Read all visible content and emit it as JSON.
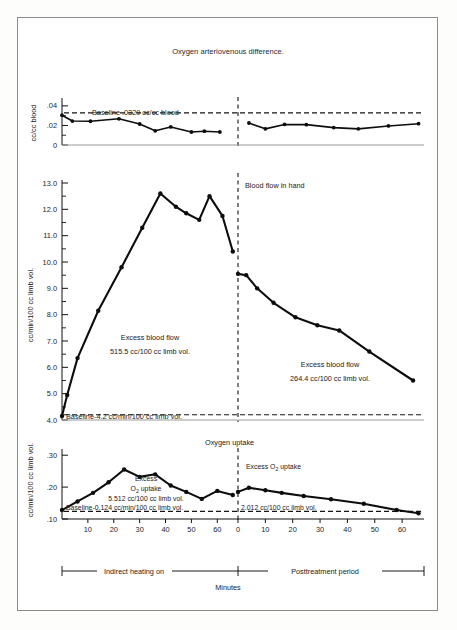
{
  "figure": {
    "title": "Oxygen arteriovenous difference.",
    "xlabel": "Minutes",
    "background": "#ffffff",
    "ink": "#0d0d0d"
  },
  "panels": {
    "top": {
      "name": "oxygen-arteriovenous-difference",
      "ylabel": "cc/cc blood",
      "ytick_labels": [
        "0",
        ".02",
        ".04"
      ],
      "baseline_label": "Baseline .0329 cc/cc blood"
    },
    "middle": {
      "name": "blood-flow-in-hand",
      "ylabel": "cc/min/100 cc limb vol.",
      "ytick_labels": [
        "4.0",
        "5.0",
        "6.0",
        "7.0",
        "8.0",
        "9.0",
        "10.0",
        "11.0",
        "12.0",
        "13.0"
      ],
      "series_label": "Blood flow in hand",
      "baseline_label": "Baseline-4.2 cc/min/100 cc limb vol.",
      "excess_left_line1": "Excess blood flow",
      "excess_left_line2": "515.5 cc/100 cc limb vol.",
      "excess_right_line1": "Excess blood flow",
      "excess_right_line2": "264.4 cc/100 cc limb vol."
    },
    "bottom": {
      "name": "oxygen-uptake",
      "ylabel": "cc/min/100 cc limb vol.",
      "ytick_labels": [
        ".10",
        ".20",
        ".30"
      ],
      "series_label": "Oxygen uptake",
      "baseline_label": "Baseline-0.124 cc/min/100 cc limb vol.",
      "excess_left_line1": "Excess",
      "excess_left_line2": "O",
      "excess_left_sub": "2",
      "excess_left_line2b": " uptake",
      "excess_left_line3": "5.512 cc/100 cc limb vol.",
      "excess_right_line1": "Excess O",
      "excess_right_sub": "2",
      "excess_right_line1b": " uptake",
      "excess_right_line2": "2.012 cc/100 cc limb vol."
    }
  },
  "xaxis": {
    "left_ticks": [
      "10",
      "20",
      "30",
      "40",
      "50",
      "60"
    ],
    "right_ticks": [
      "0",
      "10",
      "20",
      "30",
      "40",
      "50",
      "60"
    ],
    "left_range": [
      0,
      68
    ],
    "right_range": [
      0,
      68
    ]
  },
  "legend_bar": {
    "left_label": "Indirect heating on",
    "right_label": "Posttreatment period"
  },
  "chart_data": {
    "type": "line",
    "title": "Oxygen arteriovenous difference.",
    "xlabel": "Minutes",
    "panels": [
      {
        "id": "oxygen-arteriovenous-difference",
        "title": "Oxygen arteriovenous difference.",
        "ylabel": "cc/cc blood",
        "ylim": [
          0,
          0.045
        ],
        "yticks": [
          0,
          0.02,
          0.04
        ],
        "ytick_labels": [
          "0",
          ".02",
          ".04"
        ],
        "baseline_value": 0.0329,
        "baseline_label": "Baseline .0329 cc/cc blood",
        "grid": false,
        "series": [
          {
            "name": "Oxygen arteriovenous difference",
            "phase": "indirect-heating-on",
            "x": [
              0,
              4,
              11,
              22,
              30,
              36,
              42,
              50,
              55,
              61
            ],
            "y": [
              0.0305,
              0.0245,
              0.0243,
              0.0268,
              0.0215,
              0.0145,
              0.0185,
              0.0133,
              0.0141,
              0.0133
            ]
          },
          {
            "name": "Oxygen arteriovenous difference",
            "phase": "posttreatment-period",
            "x": [
              4,
              10,
              17,
              25,
              35,
              44,
              55,
              66
            ],
            "y": [
              0.0225,
              0.0165,
              0.021,
              0.0208,
              0.0178,
              0.0165,
              0.0195,
              0.0218
            ]
          }
        ]
      },
      {
        "id": "blood-flow-in-hand",
        "title": "Blood flow in hand",
        "ylabel": "cc/min/100 cc limb vol.",
        "ylim": [
          4.0,
          13.0
        ],
        "yticks": [
          4.0,
          5.0,
          6.0,
          7.0,
          8.0,
          9.0,
          10.0,
          11.0,
          12.0,
          13.0
        ],
        "ytick_labels": [
          "4.0",
          "5.0",
          "6.0",
          "7.0",
          "8.0",
          "9.0",
          "10.0",
          "11.0",
          "12.0",
          "13.0"
        ],
        "baseline_value": 4.2,
        "baseline_label": "Baseline-4.2 cc/min/100 cc limb vol.",
        "excess_left": 515.5,
        "excess_right": 264.4,
        "grid": false,
        "series": [
          {
            "name": "Blood flow in hand",
            "phase": "indirect-heating-on",
            "x": [
              0,
              2,
              6,
              14,
              23,
              31,
              38,
              44,
              48,
              53,
              57,
              62,
              66
            ],
            "y": [
              4.15,
              4.95,
              6.35,
              8.15,
              9.8,
              11.3,
              12.6,
              12.1,
              11.85,
              11.6,
              12.5,
              11.75,
              10.4
            ]
          },
          {
            "name": "Blood flow in hand",
            "phase": "posttreatment-period",
            "x": [
              0,
              3,
              7,
              13,
              21,
              29,
              37,
              48,
              64
            ],
            "y": [
              9.55,
              9.5,
              9.0,
              8.45,
              7.9,
              7.6,
              7.4,
              6.6,
              5.5
            ]
          }
        ]
      },
      {
        "id": "oxygen-uptake",
        "title": "Oxygen uptake",
        "ylabel": "cc/min/100 cc limb vol.",
        "ylim": [
          0.1,
          0.31
        ],
        "yticks": [
          0.1,
          0.2,
          0.3
        ],
        "ytick_labels": [
          ".10",
          ".20",
          ".30"
        ],
        "baseline_value": 0.124,
        "baseline_label": "Baseline-0.124 cc/min/100 cc limb vol.",
        "excess_left": 5.512,
        "excess_right": 2.012,
        "grid": false,
        "series": [
          {
            "name": "Oxygen uptake",
            "phase": "indirect-heating-on",
            "x": [
              0,
              6,
              12,
              18,
              24,
              30,
              36,
              42,
              48,
              54,
              60,
              66
            ],
            "y": [
              0.128,
              0.155,
              0.182,
              0.215,
              0.255,
              0.232,
              0.24,
              0.205,
              0.185,
              0.163,
              0.188,
              0.175
            ]
          },
          {
            "name": "Oxygen uptake",
            "phase": "posttreatment-period",
            "x": [
              0,
              4,
              10,
              16,
              24,
              34,
              46,
              58,
              66
            ],
            "y": [
              0.185,
              0.198,
              0.19,
              0.182,
              0.172,
              0.162,
              0.148,
              0.128,
              0.118
            ]
          }
        ]
      }
    ]
  }
}
